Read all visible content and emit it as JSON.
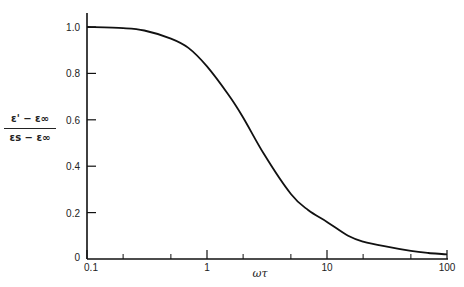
{
  "chart_data": {
    "type": "line",
    "title": "",
    "xlabel": "ωτ",
    "ylabel": "(ε' − ε∞) / (εs − ε∞)",
    "ylabel_numerator": "ε' − ε∞",
    "ylabel_denominator": "εs − ε∞",
    "xscale": "log",
    "xlim": [
      0.1,
      100
    ],
    "ylim": [
      0,
      1.05
    ],
    "grid": false,
    "legend": null,
    "x_tick_labels": [
      "0.1",
      "1",
      "10",
      "100"
    ],
    "x_major_ticks": [
      0.1,
      1,
      10,
      100
    ],
    "x_minor_ticks": [
      0.2,
      0.5,
      2,
      5,
      20,
      50
    ],
    "y_tick_labels": [
      "0",
      "0.2",
      "0.4",
      "0.6",
      "0.8",
      "1.0"
    ],
    "y_ticks": [
      0,
      0.2,
      0.4,
      0.6,
      0.8,
      1.0
    ],
    "series": [
      {
        "name": "dispersion curve",
        "x": [
          0.1,
          0.2,
          0.3,
          0.5,
          0.7,
          1.0,
          1.5,
          2.0,
          3.0,
          5.0,
          7.0,
          10,
          15,
          20,
          30,
          50,
          70,
          100
        ],
        "y": [
          1.0,
          0.995,
          0.985,
          0.95,
          0.91,
          0.83,
          0.71,
          0.61,
          0.45,
          0.28,
          0.21,
          0.16,
          0.1,
          0.075,
          0.055,
          0.035,
          0.026,
          0.02
        ]
      }
    ]
  }
}
